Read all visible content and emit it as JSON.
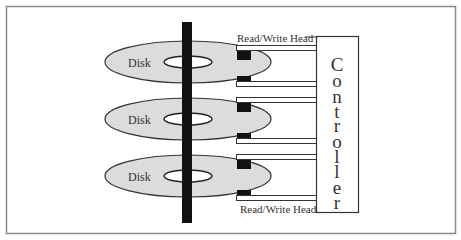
{
  "diagram": {
    "disks": [
      {
        "label": "Disk",
        "cy": 62
      },
      {
        "label": "Disk",
        "cy": 119
      },
      {
        "label": "Disk",
        "cy": 176
      }
    ],
    "head_label_top": "Read/Write Head",
    "head_label_bottom": "Read/Write Head",
    "controller_label": "Controller",
    "controller_letters": [
      "C",
      "o",
      "n",
      "t",
      "r",
      "o",
      "l",
      "l",
      "e",
      "r"
    ],
    "colors": {
      "disk_fill": "#dcdcdc",
      "stroke": "#333333",
      "spindle": "#111111",
      "frame": "#888888"
    }
  }
}
